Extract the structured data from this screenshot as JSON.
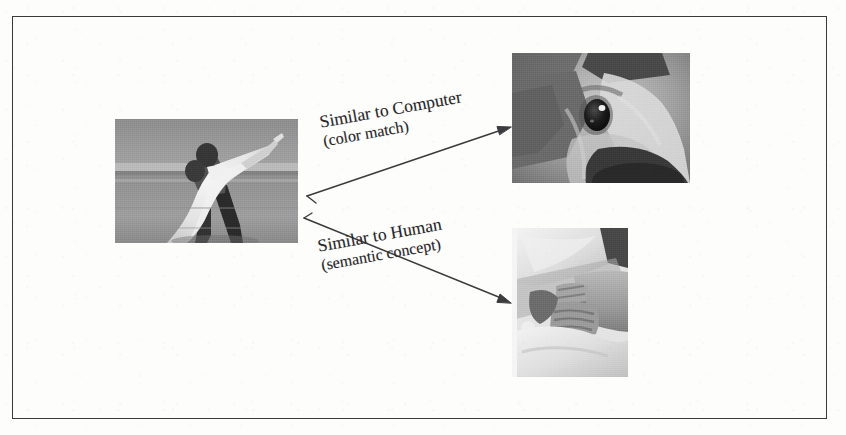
{
  "figure": {
    "kind": "annotated-image-diagram",
    "caption_present": false,
    "border_color": "#3a3a3c",
    "background_color": "#fdfdfc",
    "ink_color": "#26262a"
  },
  "images": [
    {
      "id": "query",
      "name": "wedding-couple-beach-photo",
      "alt": "Grayscale photo of a groom in dark trousers carrying a bride in a white dress on a beach, sea and horizon behind them",
      "role": "query-image",
      "x": 115,
      "y": 119,
      "width": 183,
      "height": 124
    },
    {
      "id": "dog",
      "name": "dog-face-closeup-photo",
      "alt": "Grayscale extreme close-up of a dog's face showing one dark eye, muzzle and nose",
      "role": "retrieved-by-color-match",
      "x": 512,
      "y": 53,
      "width": 178,
      "height": 130
    },
    {
      "id": "hands",
      "name": "bride-hands-closeup-photo",
      "alt": "Grayscale close-up of clasped hands resting on a white wedding dress",
      "role": "retrieved-by-semantic-concept",
      "x": 512,
      "y": 228,
      "width": 116,
      "height": 149
    }
  ],
  "edges": [
    {
      "id": "edge-computer",
      "label_line1": "Similar to Computer",
      "label_line2": "(color match)",
      "from": "query",
      "to": "dog",
      "start_x": 307,
      "start_y": 196,
      "end_x": 509,
      "end_y": 127,
      "rotation_deg": -10.2
    },
    {
      "id": "edge-human",
      "label_line1": "Similar to Human",
      "label_line2": "(semantic concept)",
      "from": "query",
      "to": "hands",
      "start_x": 304,
      "start_y": 218,
      "end_x": 510,
      "end_y": 303,
      "rotation_deg": -10.2
    }
  ]
}
